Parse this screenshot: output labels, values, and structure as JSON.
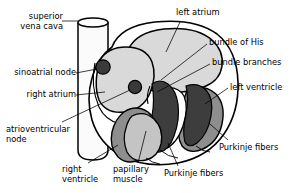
{
  "figure": {
    "background_color": "#ffffff",
    "line_color": "#000000",
    "palette": {
      "vessel_fill": "#fbfbfb",
      "atrium_fill": "#d9d9d9",
      "node_fill": "#3a3a3a",
      "conduction_fill": "#3d3d3d",
      "ventricle_wall_fill": "#8e8e8e",
      "papillary_fill": "#c4c4c4",
      "cavity_fill": "#ffffff",
      "septum_fill": "#9a9a9a"
    }
  },
  "labels": {
    "superior_vena_cava": "superior\nvena cava",
    "sinoatrial_node": "sinoatrial node",
    "right_atrium": "right atrium",
    "atrioventricular_node": "atrioventricular\nnode",
    "right_ventricle": "right\nventricle",
    "papillary_muscle": "papillary\nmuscle",
    "purkinje_fibers_bottom": "Purkinje fibers",
    "left_atrium": "left atrium",
    "bundle_of_his": "bundle of His",
    "bundle_branches": "bundle branches",
    "left_ventricle": "left ventricle",
    "purkinje_fibers_right": "Purkinje fibers"
  }
}
